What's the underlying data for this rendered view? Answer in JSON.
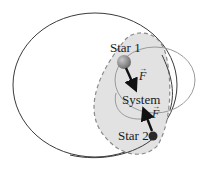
{
  "diagram": {
    "labels": {
      "star1": "Star 1",
      "star2": "Star 2",
      "system": "System",
      "force1": "F",
      "force2": "F"
    },
    "colors": {
      "orbit_line": "#3a3a3a",
      "inner_orbit_line": "#9a9a9a",
      "system_fill": "#e2e2e2",
      "system_border": "#8a8a8a",
      "star1_fill": "#8a8a8a",
      "star2_fill": "#2a2a2a",
      "arrow": "#111111"
    }
  }
}
